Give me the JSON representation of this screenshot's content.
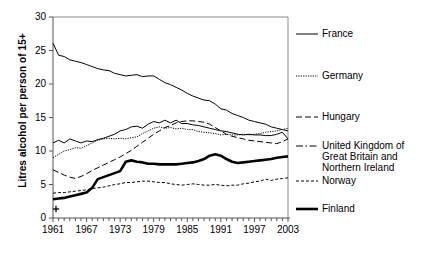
{
  "chart_data": {
    "type": "line",
    "title": "",
    "xlabel": "",
    "ylabel": "Litres alcohol per person of 15+",
    "xlim": [
      1961,
      2003
    ],
    "ylim": [
      0,
      30
    ],
    "grid": false,
    "legend_position": "right",
    "origin_marker": "+",
    "ytick_labels": [
      "0",
      "5",
      "10",
      "15",
      "20",
      "25",
      "30"
    ],
    "ytick_values": [
      0,
      5,
      10,
      15,
      20,
      25,
      30
    ],
    "xtick_labels": [
      "1961",
      "1967",
      "1973",
      "1979",
      "1985",
      "1991",
      "1997",
      "2003"
    ],
    "xtick_values": [
      1961,
      1967,
      1973,
      1979,
      1985,
      1991,
      1997,
      2003
    ],
    "x": [
      1961,
      1962,
      1963,
      1964,
      1965,
      1966,
      1967,
      1968,
      1969,
      1970,
      1971,
      1972,
      1973,
      1974,
      1975,
      1976,
      1977,
      1978,
      1979,
      1980,
      1981,
      1982,
      1983,
      1984,
      1985,
      1986,
      1987,
      1988,
      1989,
      1990,
      1991,
      1992,
      1993,
      1994,
      1995,
      1996,
      1997,
      1998,
      1999,
      2000,
      2001,
      2002,
      2003
    ],
    "series": [
      {
        "name": "France",
        "style": "solid",
        "width": 1,
        "values": [
          26.1,
          24.3,
          24.1,
          23.6,
          23.4,
          23.2,
          22.9,
          22.6,
          22.3,
          22.1,
          22.0,
          21.6,
          21.4,
          21.2,
          21.3,
          21.4,
          21.1,
          21.2,
          21.2,
          20.7,
          20.2,
          19.9,
          19.5,
          19.1,
          18.6,
          18.2,
          17.9,
          17.6,
          17.5,
          17.0,
          16.3,
          16.1,
          15.6,
          15.3,
          15.0,
          14.6,
          14.4,
          14.2,
          14.0,
          13.6,
          13.4,
          13.2,
          13.0
        ]
      },
      {
        "name": "Germany",
        "style": "dotted",
        "width": 1,
        "values": [
          9.0,
          9.5,
          10.0,
          10.2,
          10.5,
          10.4,
          10.8,
          11.2,
          11.6,
          11.8,
          11.9,
          11.8,
          11.9,
          11.8,
          12.0,
          12.1,
          12.6,
          13.0,
          13.4,
          13.6,
          13.4,
          13.5,
          13.3,
          13.4,
          13.2,
          13.2,
          12.9,
          12.8,
          12.7,
          12.6,
          12.4,
          12.5,
          12.4,
          12.4,
          12.5,
          12.4,
          12.5,
          12.6,
          12.8,
          12.9,
          13.0,
          13.2,
          13.4
        ]
      },
      {
        "name": "Hungary",
        "style": "dashed",
        "width": 1,
        "values": [
          7.2,
          6.8,
          6.4,
          6.1,
          5.9,
          6.2,
          6.6,
          7.1,
          7.5,
          7.9,
          8.3,
          8.7,
          9.1,
          9.6,
          10.1,
          10.7,
          11.3,
          11.9,
          12.5,
          13.0,
          13.5,
          13.8,
          14.2,
          14.4,
          14.5,
          14.5,
          14.4,
          14.3,
          14.0,
          13.5,
          13.0,
          12.5,
          12.2,
          12.0,
          11.8,
          11.6,
          11.5,
          11.4,
          11.3,
          11.2,
          11.1,
          11.4,
          11.8
        ]
      },
      {
        "name": "United Kingdom of Great Britain and Northern Ireland",
        "style": "solid",
        "width": 1,
        "values": [
          11.2,
          11.6,
          11.2,
          11.8,
          11.5,
          11.2,
          11.5,
          11.4,
          11.7,
          11.9,
          12.2,
          12.5,
          13.0,
          13.2,
          13.6,
          13.7,
          13.4,
          14.0,
          14.4,
          14.2,
          14.6,
          14.2,
          14.6,
          14.1,
          14.1,
          13.9,
          13.8,
          13.6,
          13.4,
          13.2,
          13.0,
          12.9,
          12.7,
          12.5,
          12.4,
          12.5,
          12.4,
          12.4,
          12.3,
          12.3,
          12.5,
          12.8,
          11.8
        ]
      },
      {
        "name": "Norway",
        "style": "dashed-fine",
        "width": 1,
        "values": [
          3.7,
          3.8,
          3.8,
          3.9,
          4.0,
          4.1,
          4.2,
          4.4,
          4.5,
          4.6,
          4.8,
          5.0,
          5.1,
          5.3,
          5.3,
          5.4,
          5.5,
          5.5,
          5.4,
          5.3,
          5.3,
          5.1,
          5.0,
          4.9,
          5.0,
          5.1,
          5.0,
          4.9,
          4.9,
          5.0,
          4.9,
          4.8,
          4.9,
          4.9,
          5.1,
          5.2,
          5.4,
          5.5,
          5.8,
          5.6,
          5.8,
          5.9,
          6.0
        ]
      },
      {
        "name": "Finland",
        "style": "solid-thick",
        "width": 2.6,
        "values": [
          2.8,
          2.9,
          3.0,
          3.2,
          3.4,
          3.6,
          3.8,
          4.5,
          5.8,
          6.1,
          6.4,
          6.7,
          7.0,
          8.4,
          8.6,
          8.4,
          8.3,
          8.1,
          8.1,
          8.0,
          8.0,
          8.0,
          8.0,
          8.1,
          8.2,
          8.3,
          8.5,
          8.8,
          9.3,
          9.5,
          9.3,
          8.8,
          8.4,
          8.2,
          8.3,
          8.4,
          8.5,
          8.6,
          8.7,
          8.8,
          9.0,
          9.1,
          9.2
        ]
      }
    ]
  },
  "legend": {
    "entries": [
      {
        "label": "France",
        "style": "solid"
      },
      {
        "label": "Germany",
        "style": "dotted"
      },
      {
        "label": "Hungary",
        "style": "dashed"
      },
      {
        "label": "United Kingdom of\nGreat Britain and\nNorthern Ireland",
        "style": "dash-dot"
      },
      {
        "label": "Norway",
        "style": "dashed-fine"
      },
      {
        "label": "Finland",
        "style": "solid-thick"
      }
    ]
  },
  "colors": {
    "line": "#000000",
    "axis": "#000000",
    "background": "#ffffff"
  }
}
